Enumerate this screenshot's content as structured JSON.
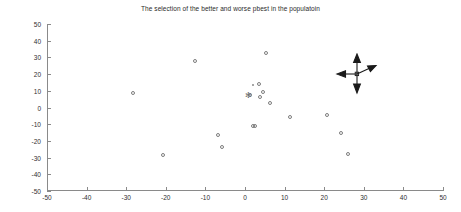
{
  "figure": {
    "title": "The selection of the better and worse pbest in the populatoin",
    "background_color": "#ffffff",
    "axis_color": "#8a8a8a",
    "marker_color": "#7d7d7d",
    "text_color": "#2f2f2f"
  },
  "chart_data": {
    "type": "scatter",
    "title": "The selection of the better and worse pbest in the populatoin",
    "xlabel": "",
    "ylabel": "",
    "xlim": [
      -50,
      50
    ],
    "ylim": [
      -50,
      50
    ],
    "grid": false,
    "legend": null,
    "xticks": [
      -50,
      -40,
      -30,
      -20,
      -10,
      0,
      10,
      20,
      30,
      40,
      50
    ],
    "yticks": [
      -50,
      -40,
      -30,
      -20,
      -10,
      0,
      10,
      20,
      30,
      40,
      50
    ],
    "xticklabels": [
      "-50",
      "-40",
      "-30",
      "-20",
      "-10",
      "0",
      "10",
      "20",
      "30",
      "40",
      "50"
    ],
    "yticklabels": [
      "50",
      "40",
      "30",
      "20",
      "10",
      "0",
      "-10",
      "-20",
      "-30",
      "-40",
      "-50"
    ],
    "series": [
      {
        "name": "population particles",
        "marker": "circle",
        "points": [
          {
            "x": -28.3,
            "y": 8.6
          },
          {
            "x": -20.7,
            "y": -28.3
          },
          {
            "x": -12.6,
            "y": 28.0
          },
          {
            "x": -6.7,
            "y": -16.6
          },
          {
            "x": -5.8,
            "y": -23.7
          },
          {
            "x": 1.3,
            "y": 7.6
          },
          {
            "x": 2.0,
            "y": -11.0
          },
          {
            "x": 2.6,
            "y": -11.3
          },
          {
            "x": 3.6,
            "y": 14.2
          },
          {
            "x": 3.8,
            "y": 6.5
          },
          {
            "x": 4.5,
            "y": 9.5
          },
          {
            "x": 5.2,
            "y": 32.9
          },
          {
            "x": 6.3,
            "y": 2.5
          },
          {
            "x": 11.3,
            "y": -5.5
          },
          {
            "x": 20.8,
            "y": -4.2
          },
          {
            "x": 24.3,
            "y": -15.5
          },
          {
            "x": 26.1,
            "y": -28.1
          }
        ]
      },
      {
        "name": "small point",
        "marker": "dot",
        "points": [
          {
            "x": 1.9,
            "y": 13.6
          }
        ]
      },
      {
        "name": "selected pbest",
        "marker": "star",
        "points": [
          {
            "x": 0.9,
            "y": 7.7
          }
        ]
      }
    ],
    "annotations": [
      {
        "type": "four-direction-arrow",
        "label": "direction-cross",
        "x": 28.2,
        "y": 19.8
      }
    ]
  }
}
